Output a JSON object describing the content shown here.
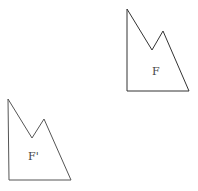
{
  "diagram": {
    "shapes": [
      {
        "name": "F",
        "label": "F",
        "points": "127,9 152,50 163,31 189,91 127,91",
        "label_x": 152,
        "label_y": 75
      },
      {
        "name": "F-prime",
        "label": "F'",
        "points": "8,99 32,138 44,119 71,180 9,180",
        "label_x": 28,
        "label_y": 160
      }
    ],
    "stroke": "#333333"
  }
}
